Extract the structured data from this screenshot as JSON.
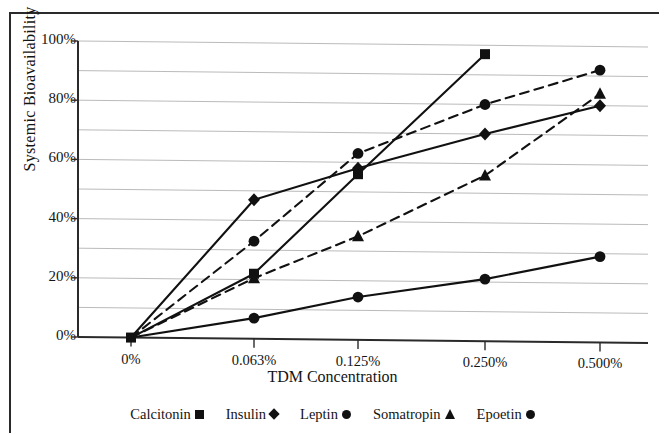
{
  "chart_data": {
    "type": "line",
    "title": "",
    "xlabel": "TDM Concentration",
    "ylabel": "Systemic Bioavailability",
    "categories": [
      "0%",
      "0.063%",
      "0.125%",
      "0.250%",
      "0.500%"
    ],
    "ytick_labels": [
      "0%",
      "20%",
      "40%",
      "60%",
      "80%",
      "100%"
    ],
    "ytick_values": [
      0,
      20,
      40,
      60,
      80,
      100
    ],
    "ylim": [
      0,
      100
    ],
    "grid": "horizontal-every-10-percent",
    "legend_position": "bottom",
    "series": [
      {
        "name": "Calcitonin",
        "marker": "square",
        "line_style": "solid",
        "color": "#111111",
        "values": [
          0,
          22,
          56,
          97,
          null
        ]
      },
      {
        "name": "Insulin",
        "marker": "diamond",
        "line_style": "solid",
        "color": "#111111",
        "values": [
          0,
          47,
          58,
          70,
          80
        ]
      },
      {
        "name": "Leptin",
        "marker": "circle",
        "line_style": "dashed",
        "color": "#111111",
        "values": [
          0,
          33,
          63,
          80,
          92
        ]
      },
      {
        "name": "Somatropin",
        "marker": "triangle",
        "line_style": "dashed",
        "color": "#111111",
        "values": [
          0,
          20.5,
          35,
          56,
          84
        ]
      },
      {
        "name": "Epoetin",
        "marker": "circle",
        "line_style": "solid",
        "color": "#111111",
        "values": [
          0,
          7,
          14.5,
          21,
          29
        ]
      }
    ]
  },
  "legend": {
    "items": [
      {
        "label": "Calcitonin",
        "marker": "square-marker-icon"
      },
      {
        "label": "Insulin",
        "marker": "diamond-marker-icon"
      },
      {
        "label": "Leptin",
        "marker": "circle-marker-icon"
      },
      {
        "label": "Somatropin",
        "marker": "triangle-marker-icon"
      },
      {
        "label": "Epoetin",
        "marker": "circle-marker-icon"
      }
    ]
  },
  "colors": {
    "ink": "#111111",
    "grid": "#9a9a9a",
    "axis": "#2a2a2a",
    "background": "#ffffff"
  }
}
